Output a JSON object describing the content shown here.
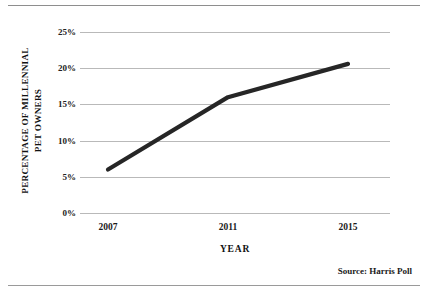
{
  "chart_data": {
    "type": "line",
    "title": "",
    "subtitle": "",
    "xlabel": "YEAR",
    "ylabel": "PERCENTAGE OF MILLENNIAL PET OWNERS",
    "ylabel_line1": "PERCENTAGE OF MILLENNIAL",
    "ylabel_line2": "PET OWNERS",
    "categories": [
      "2007",
      "2011",
      "2015"
    ],
    "x": [
      2007,
      2011,
      2015
    ],
    "values": [
      6,
      16,
      20.6
    ],
    "series": [
      {
        "name": "Percentage of millennial pet owners",
        "values": [
          6,
          16,
          20.6
        ]
      }
    ],
    "xticklabels": [
      "2007",
      "2011",
      "2015"
    ],
    "yticklabels": [
      "0%",
      "5%",
      "10%",
      "15%",
      "20%",
      "25%"
    ],
    "ytickvalues": [
      0,
      5,
      10,
      15,
      20,
      25
    ],
    "ylim": [
      0,
      25
    ],
    "grid": "horizontal",
    "legend": "none",
    "line_color": "#262626",
    "grid_color": "#b9b9b9"
  },
  "annotations": {
    "source": "Source: Harris Poll"
  }
}
